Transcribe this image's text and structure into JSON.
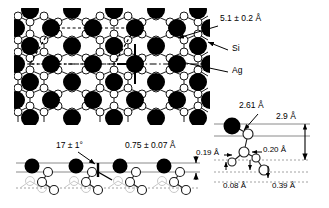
{
  "figure": {
    "name": "ag-si-surface-reconstruction-model",
    "panels": {
      "top_view": {
        "name": "top-view-lattice",
        "atom_legend": [
          {
            "key": "si",
            "label": "Si",
            "style": "open-circle"
          },
          {
            "key": "ag",
            "label": "Ag",
            "style": "filled-circle"
          }
        ],
        "annotations": [
          {
            "name": "ag-triangle-spacing",
            "text": "5.1 ± 0.2 Å"
          }
        ]
      },
      "side_view": {
        "name": "side-view-lattice",
        "annotations": [
          {
            "name": "tilt-angle",
            "text": "17 ± 1°"
          },
          {
            "name": "layer-separation",
            "text": "0.75 ± 0.07 Å"
          }
        ]
      },
      "detail_view": {
        "name": "detail-side-view",
        "annotations": [
          {
            "name": "ag-si-bond-length",
            "text": "2.61 Å"
          },
          {
            "name": "total-height",
            "text": "2.9 Å"
          },
          {
            "name": "lateral-offset-left",
            "text": "0.19 Å"
          },
          {
            "name": "lateral-offset-right",
            "text": "0.20 Å"
          },
          {
            "name": "vertical-offset-small",
            "text": "0.08 Å"
          },
          {
            "name": "vertical-offset-large",
            "text": "0.39 Å"
          }
        ]
      }
    },
    "colors": {
      "ag_fill": "#000000",
      "si_fill": "#ffffff",
      "si_stroke": "#1a1a1a",
      "ghost_stroke": "#c8c8c8",
      "guide_line": "#8a8a8a"
    }
  }
}
